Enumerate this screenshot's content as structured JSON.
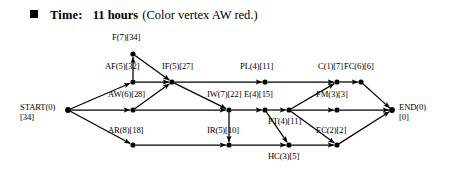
{
  "header": {
    "bullet_icon": "square-bullet-icon",
    "label": "Time:",
    "value": "11 hours",
    "note": "(Color vertex AW red.)"
  },
  "diagram": {
    "type": "critical-path-activity-network",
    "nodes": [
      {
        "id": "START",
        "label": "START(0)",
        "sub": "[34]",
        "duration": 0,
        "slack": 34,
        "x": 68,
        "y": 110,
        "label_x": 20,
        "label_y": 103,
        "align": "left",
        "two_line": true
      },
      {
        "id": "F",
        "label": "F(7)[34]",
        "sub": "",
        "duration": 7,
        "slack": 34,
        "x": 133,
        "y": 54,
        "label_x": 112,
        "label_y": 33,
        "align": "center",
        "two_line": false
      },
      {
        "id": "AF",
        "label": "AF(5)[32]",
        "sub": "",
        "duration": 5,
        "slack": 32,
        "x": 133,
        "y": 82,
        "label_x": 105,
        "label_y": 62,
        "align": "center",
        "two_line": false
      },
      {
        "id": "AW",
        "label": "AW(6)[28]",
        "sub": "",
        "duration": 6,
        "slack": 28,
        "x": 133,
        "y": 110,
        "label_x": 108,
        "label_y": 90,
        "align": "center",
        "two_line": false
      },
      {
        "id": "AR",
        "label": "AR(8)[18]",
        "sub": "",
        "duration": 8,
        "slack": 18,
        "x": 133,
        "y": 145,
        "label_x": 108,
        "label_y": 126,
        "align": "center",
        "two_line": false
      },
      {
        "id": "IF",
        "label": "IF(5)[27]",
        "sub": "",
        "duration": 5,
        "slack": 27,
        "x": 172,
        "y": 82,
        "label_x": 162,
        "label_y": 62,
        "align": "center",
        "two_line": false
      },
      {
        "id": "IW",
        "label": "IW(7)[22]",
        "sub": "",
        "duration": 7,
        "slack": 22,
        "x": 229,
        "y": 110,
        "label_x": 207,
        "label_y": 90,
        "align": "center",
        "two_line": false
      },
      {
        "id": "IR",
        "label": "IR(5)[10]",
        "sub": "",
        "duration": 5,
        "slack": 10,
        "x": 229,
        "y": 145,
        "label_x": 207,
        "label_y": 126,
        "align": "center",
        "two_line": false
      },
      {
        "id": "PL",
        "label": "PL(4)[11]",
        "sub": "",
        "duration": 4,
        "slack": 11,
        "x": 265,
        "y": 82,
        "label_x": 240,
        "label_y": 62,
        "align": "center",
        "two_line": false
      },
      {
        "id": "E",
        "label": "E(4)[15]",
        "sub": "",
        "duration": 4,
        "slack": 15,
        "x": 265,
        "y": 110,
        "label_x": 244,
        "label_y": 90,
        "align": "center",
        "two_line": false
      },
      {
        "id": "PT",
        "label": "PT(4)[11]",
        "sub": "",
        "duration": 4,
        "slack": 11,
        "x": 289,
        "y": 110,
        "label_x": 268,
        "label_y": 117,
        "align": "center",
        "two_line": false
      },
      {
        "id": "HC",
        "label": "HC(3)[5]",
        "sub": "",
        "duration": 3,
        "slack": 5,
        "x": 289,
        "y": 145,
        "label_x": 268,
        "label_y": 152,
        "align": "center",
        "two_line": false
      },
      {
        "id": "C",
        "label": "C(1)[7]",
        "sub": "",
        "duration": 1,
        "slack": 7,
        "x": 337,
        "y": 82,
        "label_x": 318,
        "label_y": 62,
        "align": "center",
        "two_line": false
      },
      {
        "id": "FC",
        "label": "FC(6)[6]",
        "sub": "",
        "duration": 6,
        "slack": 6,
        "x": 361,
        "y": 82,
        "label_x": 344,
        "label_y": 62,
        "align": "center",
        "two_line": false
      },
      {
        "id": "FM",
        "label": "FM(3)[3]",
        "sub": "",
        "duration": 3,
        "slack": 3,
        "x": 337,
        "y": 110,
        "label_x": 316,
        "label_y": 90,
        "align": "center",
        "two_line": false
      },
      {
        "id": "EC",
        "label": "EC(2)[2]",
        "sub": "",
        "duration": 2,
        "slack": 2,
        "x": 337,
        "y": 145,
        "label_x": 316,
        "label_y": 126,
        "align": "center",
        "two_line": false
      },
      {
        "id": "END",
        "label": "END(0)",
        "sub": "[0]",
        "duration": 0,
        "slack": 0,
        "x": 392,
        "y": 110,
        "label_x": 399,
        "label_y": 103,
        "align": "left",
        "two_line": true
      }
    ],
    "edges": [
      {
        "from": "START",
        "to": "AF",
        "arrow": true
      },
      {
        "from": "START",
        "to": "AW",
        "arrow": true
      },
      {
        "from": "START",
        "to": "AR",
        "arrow": true
      },
      {
        "from": "AF",
        "to": "F",
        "arrow": true
      },
      {
        "from": "AF",
        "to": "IF",
        "arrow": true
      },
      {
        "from": "F",
        "to": "IF",
        "arrow": true
      },
      {
        "from": "AW",
        "to": "IF",
        "arrow": true
      },
      {
        "from": "AW",
        "to": "IW",
        "arrow": true
      },
      {
        "from": "IF",
        "to": "PL",
        "arrow": true
      },
      {
        "from": "IF",
        "to": "IW",
        "arrow": true
      },
      {
        "from": "AR",
        "to": "IR",
        "arrow": true
      },
      {
        "from": "IW",
        "to": "E",
        "arrow": true
      },
      {
        "from": "IW",
        "to": "IR",
        "arrow": true
      },
      {
        "from": "PL",
        "to": "C",
        "arrow": true
      },
      {
        "from": "E",
        "to": "PT",
        "arrow": true
      },
      {
        "from": "E",
        "to": "HC",
        "arrow": true
      },
      {
        "from": "IR",
        "to": "HC",
        "arrow": true
      },
      {
        "from": "PT",
        "to": "C",
        "arrow": true
      },
      {
        "from": "PT",
        "to": "FM",
        "arrow": true
      },
      {
        "from": "PT",
        "to": "EC",
        "arrow": true
      },
      {
        "from": "HC",
        "to": "EC",
        "arrow": true
      },
      {
        "from": "C",
        "to": "FC",
        "arrow": true
      },
      {
        "from": "FC",
        "to": "END",
        "arrow": true
      },
      {
        "from": "FM",
        "to": "END",
        "arrow": true
      },
      {
        "from": "EC",
        "to": "END",
        "arrow": true
      }
    ],
    "colors": {
      "stroke": "#000000",
      "node_fill": "#000000",
      "background": "#ffffff"
    }
  }
}
